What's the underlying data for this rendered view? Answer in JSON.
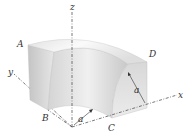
{
  "figure": {
    "axes": {
      "x_label": "x",
      "y_label": "y",
      "z_label": "z"
    },
    "points": {
      "A": "A",
      "B": "B",
      "C": "C",
      "D": "D"
    },
    "dimensions": {
      "inner_radius_label": "a",
      "side_label": "a"
    },
    "colors": {
      "surface_light": "#f4f4f4",
      "surface_mid": "#d9d9d9",
      "surface_dark": "#b8b8b8",
      "axis_line": "#555555",
      "label": "#333333"
    }
  }
}
